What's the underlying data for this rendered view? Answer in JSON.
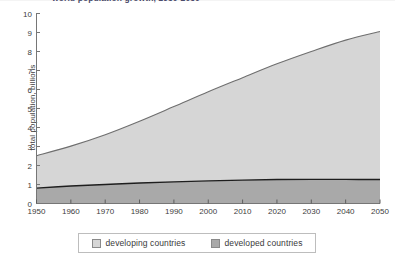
{
  "chart_data": {
    "type": "area",
    "stacked": true,
    "title": "world population growth, 1950-2050",
    "xlabel": "",
    "ylabel": "total population, billions",
    "xlim": [
      1950,
      2050
    ],
    "ylim": [
      0,
      10
    ],
    "grid": false,
    "legend_position": "bottom",
    "x": [
      1950,
      1960,
      1970,
      1980,
      1990,
      2000,
      2010,
      2020,
      2030,
      2040,
      2050
    ],
    "xticks": [
      "1950",
      "1960",
      "1970",
      "1980",
      "1990",
      "2000",
      "2010",
      "2020",
      "2030",
      "2040",
      "2050"
    ],
    "yticks": [
      "0",
      "1",
      "2",
      "3",
      "4",
      "5",
      "6",
      "7",
      "8",
      "9",
      "10"
    ],
    "series": [
      {
        "name": "developed countries",
        "color": "#a9a9a9",
        "values": [
          0.81,
          0.92,
          1.0,
          1.08,
          1.14,
          1.19,
          1.23,
          1.26,
          1.27,
          1.27,
          1.26
        ]
      },
      {
        "name": "developing countries",
        "color": "#d6d6d6",
        "values": [
          1.71,
          2.12,
          2.7,
          3.36,
          4.15,
          4.92,
          5.68,
          6.5,
          7.24,
          7.84,
          8.29
        ]
      }
    ],
    "totals": [
      2.52,
      3.04,
      3.7,
      4.44,
      5.29,
      6.11,
      6.91,
      7.76,
      8.51,
      9.11,
      9.55
    ],
    "total_curve_plotted": [
      2.52,
      3.02,
      3.62,
      4.33,
      5.1,
      5.88,
      6.62,
      7.35,
      8.0,
      8.6,
      9.05
    ]
  },
  "legend": {
    "entries": [
      {
        "label": "developing countries",
        "swatch": "#d6d6d6"
      },
      {
        "label": "developed countries",
        "swatch": "#a9a9a9"
      }
    ]
  },
  "axis": {
    "y_title": "total population, billions",
    "y_ticks": [
      "10",
      "9",
      "8",
      "7",
      "6",
      "5",
      "4",
      "3",
      "2",
      "1",
      "0"
    ],
    "x_ticks": [
      "1950",
      "1960",
      "1970",
      "1980",
      "1990",
      "2000",
      "2010",
      "2020",
      "2030",
      "2040",
      "2050"
    ]
  },
  "title": {
    "text": "world population growth, 1950-2050"
  }
}
